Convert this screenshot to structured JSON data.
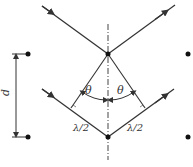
{
  "diagram": {
    "labels": {
      "spacing": "d",
      "angle_left": "θ",
      "angle_right": "θ",
      "path_left": "λ/2",
      "path_right": "λ/2"
    },
    "colors": {
      "line": "#333333",
      "atom": "#111111",
      "background": "#ffffff"
    },
    "atoms": [
      {
        "x": 28,
        "y": 54
      },
      {
        "x": 108,
        "y": 54
      },
      {
        "x": 188,
        "y": 54
      },
      {
        "x": 28,
        "y": 137
      },
      {
        "x": 108,
        "y": 137
      },
      {
        "x": 188,
        "y": 137
      }
    ]
  }
}
